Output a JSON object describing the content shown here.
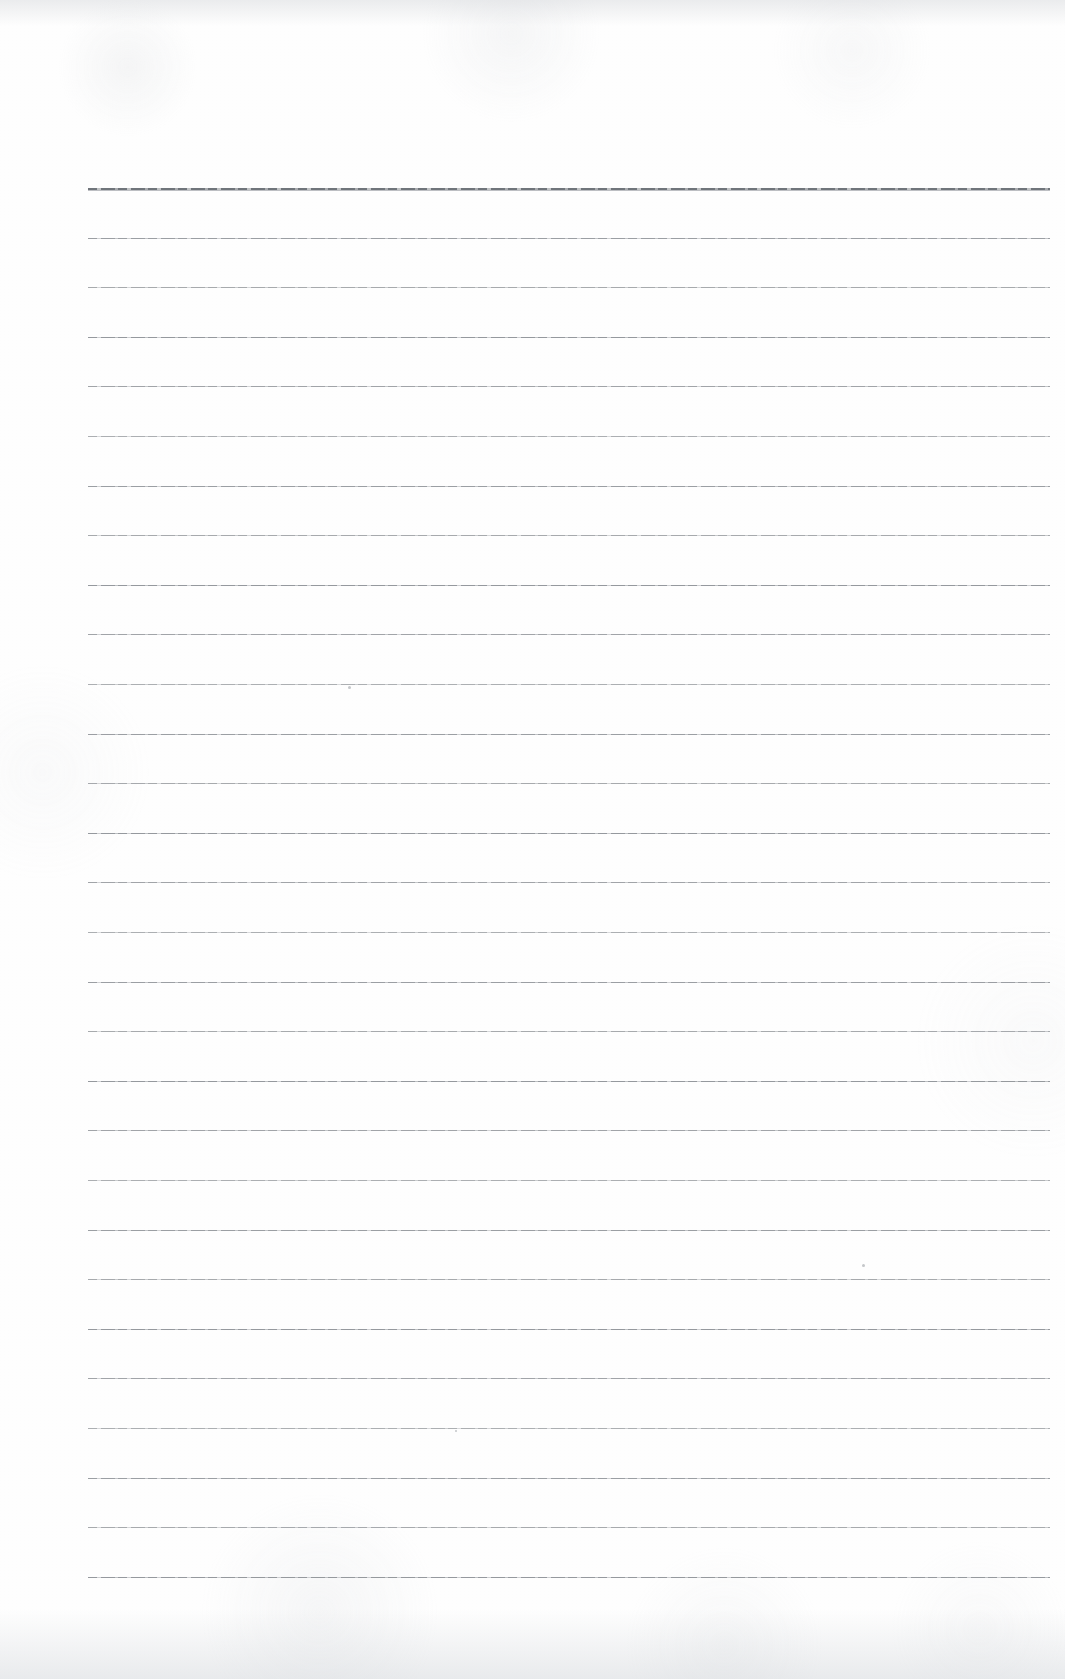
{
  "document": {
    "kind": "scanned-blank-ruled-notebook-page",
    "page_width": 1065,
    "page_height": 1679,
    "paper_color": "#fefefe",
    "has_text_content": false,
    "text_content": "",
    "margin_line": "none",
    "page_number": "",
    "header_text": "",
    "footer_text": ""
  },
  "rules": {
    "count": 29,
    "first_line_y": 188,
    "spacing": 49.6,
    "left_x": 88,
    "right_x": 1050,
    "line_color": "#8d9196",
    "header_rule_color": "#70757b",
    "header_rule_index": 0,
    "ys": [
      188,
      237.6,
      287.2,
      336.8,
      386.4,
      436,
      485.6,
      535.2,
      584.8,
      634.4,
      684,
      733.6,
      783.2,
      832.8,
      882.4,
      932,
      981.6,
      1031.2,
      1080.8,
      1130.4,
      1180,
      1229.6,
      1279.2,
      1328.8,
      1378.4,
      1428,
      1477.6,
      1527.2,
      1576.8
    ]
  },
  "artifacts": {
    "specks": [
      {
        "x": 348,
        "y": 686,
        "size": 3
      },
      {
        "x": 862,
        "y": 1264,
        "size": 3
      },
      {
        "x": 455,
        "y": 1430,
        "size": 2
      }
    ],
    "edge_shading": "top-and-bottom"
  }
}
